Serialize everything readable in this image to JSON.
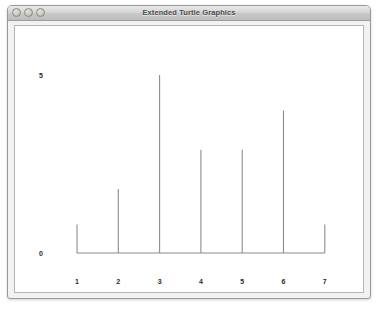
{
  "window": {
    "title": "Extended Turtle Graphics",
    "traffic_lights": [
      {
        "name": "close-button",
        "label": "Close"
      },
      {
        "name": "minimize-button",
        "label": "Minimize"
      },
      {
        "name": "zoom-button",
        "label": "Zoom"
      }
    ]
  },
  "chart_data": {
    "type": "bar",
    "title": "",
    "subtitle": "",
    "xlabel": "",
    "ylabel": "",
    "categories": [
      "1",
      "2",
      "3",
      "4",
      "5",
      "6",
      "7"
    ],
    "values": [
      0.8,
      1.8,
      5.0,
      2.9,
      2.9,
      4.0,
      0.8
    ],
    "y_ticks": [
      "0",
      "5"
    ],
    "y_tick_values": [
      0,
      5
    ],
    "ylim": [
      0,
      5.2
    ],
    "grid": false,
    "legend": null,
    "bar_color": "#8c8c8c",
    "axis_color": "#8c8c8c",
    "background": "#ffffff",
    "annotations": []
  }
}
